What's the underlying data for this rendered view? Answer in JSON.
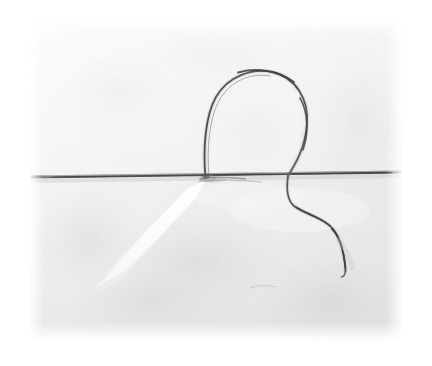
{
  "figure": {
    "domain": "Natural-Image",
    "description": "Halftone-printed monochrome photograph of a fine thread looped over a straight needle laid across a pale woven fabric, with the thread tail curving away below.",
    "canvas": {
      "width": 432,
      "height": 366,
      "background": "#ffffff"
    },
    "photo_bounds": {
      "x": 30,
      "y": 20,
      "width": 372,
      "height": 320
    },
    "visible_text": [],
    "colors": {
      "page_background": "#ffffff",
      "fabric_light": "#f4f4f3",
      "fabric_mid": "#e8e8e7",
      "fabric_shadow": "#d9d9d8",
      "fabric_highlight": "#fdfdfd",
      "thread_dark": "#4a4a4c",
      "thread_mid": "#6e6e70",
      "needle_dark": "#55565a",
      "needle_mid": "#76777b",
      "halftone_dot": "#d2d2d1"
    },
    "elements": {
      "needle": {
        "name": "horizontal straight needle",
        "x1": 30,
        "y1": 177,
        "x2": 402,
        "y2": 172,
        "stroke_width": 3.0
      },
      "thread_loop": {
        "name": "thread loop above needle",
        "base_left_x": 205,
        "base_right_x": 288,
        "apex_y": 78,
        "apex_x": 252,
        "left_span_x": 206,
        "right_span_x": 306
      },
      "thread_tail": {
        "name": "thread tail below needle",
        "start_x": 288,
        "start_y": 176,
        "end_x": 346,
        "end_y": 271,
        "sweep_max_x": 341
      },
      "fabric_crease": {
        "name": "bright diagonal fold highlight",
        "from_x": 198,
        "from_y": 182,
        "to_x": 96,
        "to_y": 272
      },
      "fabric_shadow_patch": {
        "name": "soft shadow below needle centre",
        "cx": 196,
        "cy": 262,
        "rx": 84,
        "ry": 48
      }
    }
  }
}
